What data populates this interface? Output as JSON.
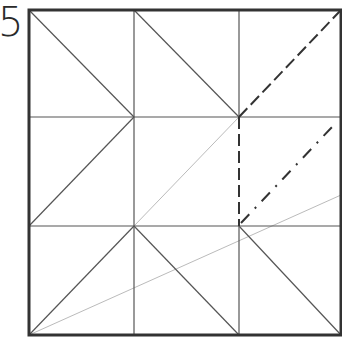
{
  "diagram": {
    "step_number": "5",
    "colors": {
      "border": "#333333",
      "line": "#555555",
      "light_line": "#bbbbbb",
      "background": "#ffffff"
    },
    "square": {
      "x1": 29,
      "y1": 10,
      "x2": 341,
      "y2": 335
    },
    "grid_lines": [
      {
        "x1": 134,
        "y1": 10,
        "x2": 134,
        "y2": 335
      },
      {
        "x1": 239,
        "y1": 10,
        "x2": 239,
        "y2": 117
      },
      {
        "x1": 239,
        "y1": 226,
        "x2": 239,
        "y2": 335
      },
      {
        "x1": 29,
        "y1": 117,
        "x2": 341,
        "y2": 117
      },
      {
        "x1": 29,
        "y1": 226,
        "x2": 341,
        "y2": 226
      }
    ],
    "diagonal_creases": [
      {
        "x1": 29,
        "y1": 10,
        "x2": 134,
        "y2": 117
      },
      {
        "x1": 134,
        "y1": 10,
        "x2": 239,
        "y2": 117
      },
      {
        "x1": 134,
        "y1": 117,
        "x2": 29,
        "y2": 226
      },
      {
        "x1": 134,
        "y1": 226,
        "x2": 29,
        "y2": 335
      },
      {
        "x1": 134,
        "y1": 226,
        "x2": 239,
        "y2": 335
      },
      {
        "x1": 239,
        "y1": 226,
        "x2": 341,
        "y2": 335
      }
    ],
    "valley_folds_dashed": [
      {
        "x1": 239,
        "y1": 117,
        "x2": 341,
        "y2": 10
      },
      {
        "x1": 239,
        "y1": 117,
        "x2": 239,
        "y2": 226
      }
    ],
    "mountain_fold_dash_dot": [
      {
        "x1": 241,
        "y1": 223,
        "x2": 333,
        "y2": 126
      }
    ],
    "light_reference_lines": [
      {
        "x1": 134,
        "y1": 226,
        "x2": 239,
        "y2": 117
      },
      {
        "x1": 29,
        "y1": 335,
        "x2": 341,
        "y2": 195
      }
    ]
  }
}
